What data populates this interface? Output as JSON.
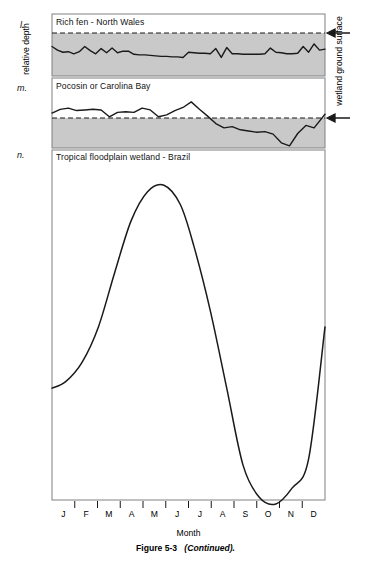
{
  "figure": {
    "caption_label": "Figure 5-3",
    "caption_note": "(Continued).",
    "axis_left_label": "relative depth",
    "axis_right_label": "wetland ground surface",
    "axis_bottom_label": "Month",
    "shade_color": "#c9c9c9",
    "line_color": "#1a1a1a",
    "frame_color": "#808080"
  },
  "months": [
    "J",
    "F",
    "M",
    "A",
    "M",
    "J",
    "J",
    "A",
    "S",
    "O",
    "N",
    "D"
  ],
  "panels": [
    {
      "letter": "l.",
      "title": "Rich fen - North Wales"
    },
    {
      "letter": "m.",
      "title": "Pocosin or Carolina Bay"
    },
    {
      "letter": "n.",
      "title": "Tropical floodplain wetland - Brazil"
    }
  ],
  "chart_data": [
    {
      "type": "line",
      "title": "Rich fen - North Wales",
      "panel": "l",
      "xlabel": "Month",
      "ylabel": "relative depth",
      "annotation": "wetland ground surface",
      "ground_surface_level": 0,
      "note": "water table fluctuates just below ground surface all year; shaded zone is below ground surface",
      "x": [
        0,
        2,
        4,
        6,
        8,
        10,
        12,
        14,
        16,
        18,
        20,
        22,
        24,
        26,
        28,
        30,
        32,
        34,
        36,
        38,
        40,
        42,
        44,
        46,
        48,
        50,
        52,
        54,
        56,
        58,
        60,
        62,
        64,
        66,
        68,
        70,
        72,
        74,
        76,
        78,
        80,
        82,
        84,
        86,
        88,
        90,
        92,
        94,
        96,
        98,
        100
      ],
      "values": [
        -26,
        -33,
        -37,
        -36,
        -40,
        -36,
        -26,
        -34,
        -40,
        -30,
        -38,
        -29,
        -38,
        -35,
        -35,
        -41,
        -42,
        -42,
        -43,
        -44,
        -45,
        -45,
        -46,
        -46,
        -47,
        -37,
        -38,
        -39,
        -39,
        -40,
        -30,
        -47,
        -28,
        -40,
        -40,
        -41,
        -41,
        -41,
        -41,
        -40,
        -29,
        -37,
        -38,
        -40,
        -40,
        -39,
        -26,
        -37,
        -21,
        -33,
        -31
      ]
    },
    {
      "type": "line",
      "title": "Pocosin or Carolina Bay",
      "panel": "m",
      "xlabel": "Month",
      "ylabel": "relative depth",
      "annotation": "wetland ground surface",
      "ground_surface_level": 0,
      "note": "water level above ground surface in winter/spring, drops well below surface in summer/fall, recovers in December",
      "x": [
        0,
        3,
        6,
        9,
        12,
        15,
        18,
        21,
        24,
        27,
        30,
        33,
        36,
        39,
        42,
        45,
        48,
        51,
        54,
        57,
        60,
        63,
        66,
        69,
        72,
        75,
        78,
        81,
        84,
        87,
        90,
        93,
        96,
        100
      ],
      "values": [
        8,
        14,
        16,
        12,
        13,
        14,
        13,
        2,
        9,
        10,
        9,
        16,
        13,
        2,
        5,
        12,
        17,
        26,
        14,
        3,
        -9,
        -16,
        -14,
        -19,
        -21,
        -23,
        -22,
        -26,
        -40,
        -45,
        -25,
        -12,
        -16,
        6
      ]
    },
    {
      "type": "line",
      "title": "Tropical floodplain wetland - Brazil",
      "panel": "n",
      "xlabel": "Month",
      "ylabel": "relative depth",
      "note": "strong unimodal annual flood pulse; peak water level in late May/June, minimum in October",
      "categories": [
        "J",
        "F",
        "M",
        "A",
        "M",
        "J",
        "J",
        "A",
        "S",
        "O",
        "N",
        "D"
      ],
      "x": [
        0,
        5,
        11,
        17,
        23,
        29,
        35,
        41,
        47,
        52,
        58,
        64,
        70,
        76,
        82,
        88,
        94,
        100
      ],
      "values": [
        36,
        38,
        44,
        55,
        72,
        88,
        97,
        99,
        93,
        80,
        60,
        36,
        12,
        2,
        0,
        5,
        14,
        55
      ]
    }
  ]
}
